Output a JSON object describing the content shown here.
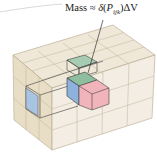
{
  "annotation": {
    "text": "Mass ≈ δ(P_ijk)ΔV",
    "prefix": "Mass ≈ ",
    "func": "δ",
    "open": "(",
    "point": "P",
    "subscript": "ijk",
    "close": ")",
    "suffix": "ΔV"
  },
  "colors": {
    "background": "#ffffff",
    "box_fill_top": "#efe7d6",
    "box_fill_left": "#e3d6b8",
    "box_fill_front": "#f1ebdf",
    "grid_line": "#b8ab90",
    "highlight_green": "#9fc4ad",
    "highlight_blue": "#8fb2dc",
    "highlight_pink": "#f0b3b8",
    "edge_dark": "#3a3a3a"
  }
}
